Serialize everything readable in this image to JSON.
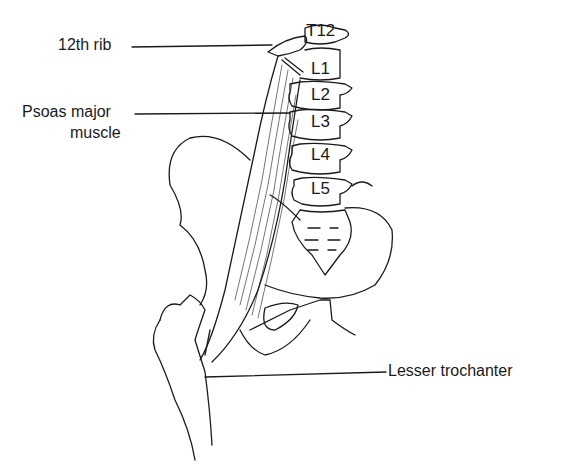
{
  "diagram": {
    "labels": {
      "rib": "12th rib",
      "psoas_line1": "Psoas major",
      "psoas_line2": "muscle",
      "trochanter": "Lesser trochanter"
    },
    "vertebrae": [
      "T12",
      "L1",
      "L2",
      "L3",
      "L4",
      "L5"
    ],
    "colors": {
      "ink": "#1a1a1a",
      "background": "#ffffff"
    }
  }
}
